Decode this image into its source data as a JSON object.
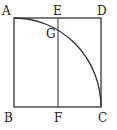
{
  "diagram": {
    "type": "geometric-figure",
    "labels": {
      "A": "A",
      "E": "E",
      "D": "D",
      "G": "G",
      "B": "B",
      "F": "F",
      "C": "C"
    },
    "points": {
      "A": [
        14,
        18
      ],
      "E": [
        58,
        18
      ],
      "D": [
        101,
        18
      ],
      "B": [
        14,
        107
      ],
      "F": [
        58,
        107
      ],
      "C": [
        101,
        107
      ],
      "G": [
        58,
        30
      ]
    },
    "stroke_color": "#333333"
  }
}
